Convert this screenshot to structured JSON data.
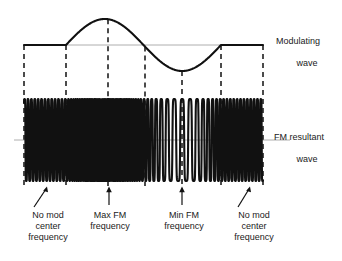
{
  "figure": {
    "background_color": "#ffffff",
    "stroke_color": "#111111",
    "axis_color": "#9a9a9a"
  },
  "labels": {
    "modulating_wave_line1": "Modulating",
    "modulating_wave_line2": "wave",
    "fm_resultant_line1": "FM resultant",
    "fm_resultant_line2": "wave",
    "no_mod_center_frequency_left": "No mod\ncenter\nfrequency",
    "max_fm_frequency": "Max FM\nfrequency",
    "min_fm_frequency": "Min FM\nfrequency",
    "no_mod_center_frequency_right": "No mod\ncenter\nfrequency"
  },
  "chart_data": {
    "type": "line",
    "xlabel": "",
    "ylabel": "",
    "grid": false,
    "legend": "right-side annotations",
    "axis_ranges": {
      "x_pixels": [
        24,
        263
      ],
      "modulating_baseline_y": 45,
      "fm_center_y": 140,
      "fm_amplitude_px": 41
    },
    "marker_lines_x": [
      24,
      66,
      108,
      145,
      182,
      221,
      263
    ],
    "series": [
      {
        "name": "Modulating wave",
        "description": "Flat baseline, one full sine cycle (positive half then negative half), then flat baseline",
        "segments": [
          {
            "type": "flat",
            "x_start": 24,
            "x_end": 66,
            "value": 0
          },
          {
            "type": "sine",
            "x_start": 66,
            "x_end": 221,
            "peak_x": 108,
            "trough_x": 182,
            "zero_x": 145,
            "amplitude": 1
          },
          {
            "type": "flat",
            "x_start": 221,
            "x_end": 263,
            "value": 0
          }
        ]
      },
      {
        "name": "FM resultant wave",
        "description": "Carrier whose instantaneous frequency follows the modulating wave amplitude: nominal at flat regions, maximum at modulating peak, minimum at modulating trough",
        "frequency_profile": [
          {
            "x": 24,
            "relative_frequency": 1.0,
            "state": "no mod center frequency"
          },
          {
            "x": 66,
            "relative_frequency": 1.0,
            "state": "no mod center frequency"
          },
          {
            "x": 108,
            "relative_frequency": 2.6,
            "state": "max FM frequency"
          },
          {
            "x": 145,
            "relative_frequency": 1.0,
            "state": "center frequency"
          },
          {
            "x": 182,
            "relative_frequency": 0.42,
            "state": "min FM frequency"
          },
          {
            "x": 221,
            "relative_frequency": 1.0,
            "state": "no mod center frequency"
          },
          {
            "x": 263,
            "relative_frequency": 1.0,
            "state": "no mod center frequency"
          }
        ]
      }
    ],
    "annotations": [
      {
        "text": "No mod center frequency",
        "arrow": "diagonal-up-right",
        "points_to_x": 47,
        "points_to_y": 186
      },
      {
        "text": "Max FM frequency",
        "arrow": "vertical-up",
        "points_to_x": 109,
        "points_to_y": 186
      },
      {
        "text": "Min FM frequency",
        "arrow": "vertical-up",
        "points_to_x": 182,
        "points_to_y": 186
      },
      {
        "text": "No mod center frequency",
        "arrow": "diagonal-up-right",
        "points_to_x": 250,
        "points_to_y": 186
      }
    ]
  }
}
